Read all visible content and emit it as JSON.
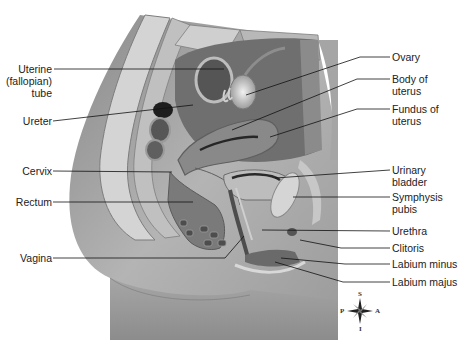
{
  "diagram": {
    "labels_left": [
      {
        "id": "uterine-tube",
        "lines": [
          "Uterine",
          "(fallopian)",
          "tube"
        ]
      },
      {
        "id": "ureter",
        "lines": [
          "Ureter"
        ]
      },
      {
        "id": "cervix",
        "lines": [
          "Cervix"
        ]
      },
      {
        "id": "rectum",
        "lines": [
          "Rectum"
        ]
      },
      {
        "id": "vagina",
        "lines": [
          "Vagina"
        ]
      }
    ],
    "labels_right": [
      {
        "id": "ovary",
        "lines": [
          "Ovary"
        ]
      },
      {
        "id": "body-of-uterus",
        "lines": [
          "Body of",
          "uterus"
        ]
      },
      {
        "id": "fundus-of-uterus",
        "lines": [
          "Fundus of",
          "uterus"
        ]
      },
      {
        "id": "urinary-bladder",
        "lines": [
          "Urinary",
          "bladder"
        ]
      },
      {
        "id": "symphysis-pubis",
        "lines": [
          "Symphysis",
          "pubis"
        ]
      },
      {
        "id": "urethra",
        "lines": [
          "Urethra"
        ]
      },
      {
        "id": "clitoris",
        "lines": [
          "Clitoris"
        ]
      },
      {
        "id": "labium-minus",
        "lines": [
          "Labium minus"
        ]
      },
      {
        "id": "labium-majus",
        "lines": [
          "Labium majus"
        ]
      }
    ],
    "compass": {
      "superior": "S",
      "inferior": "I",
      "posterior": "P",
      "anterior": "A"
    }
  }
}
